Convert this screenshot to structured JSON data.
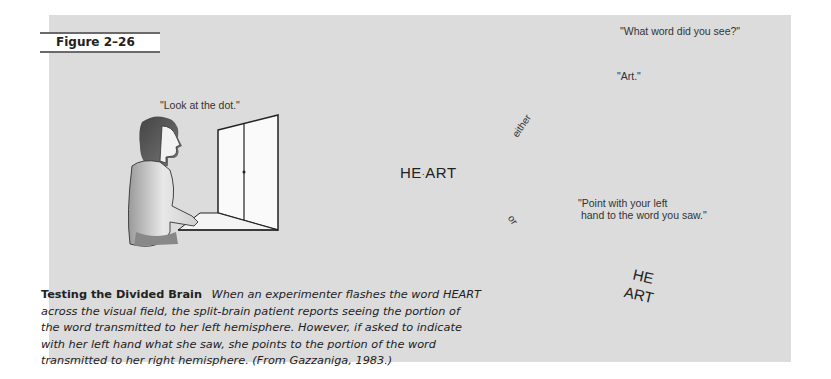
{
  "figure": {
    "label": "Figure 2–26"
  },
  "scenes": [
    {
      "id": "look",
      "quote": "\"Look at the dot.\"",
      "screen_text": ""
    },
    {
      "id": "flash",
      "quote": "",
      "screen_text_left": "HE",
      "screen_text_right": "ART"
    },
    {
      "id": "verbal",
      "question": "\"What word did you see?\"",
      "answer": "\"Art.\""
    },
    {
      "id": "point",
      "question": "\"Point with your left\n hand to the word you saw.\"",
      "card_line1": "HE",
      "card_line2": "ART"
    }
  ],
  "branches": {
    "upper_label": "either",
    "lower_label": "or"
  },
  "caption": {
    "title": "Testing the Divided Brain",
    "body": "When an experimenter flashes the word HEART across the visual field, the split-brain patient reports seeing the portion of the word transmitted to her left hemisphere. However, if asked to indicate with her left hand what she saw, she points to the portion of the word transmitted to her right hemisphere. (From Gazzaniga, 1983.)"
  },
  "colors": {
    "panel_bg": "#dcdcdc",
    "ink": "#222222",
    "label_rule": "#6a6a6a"
  }
}
